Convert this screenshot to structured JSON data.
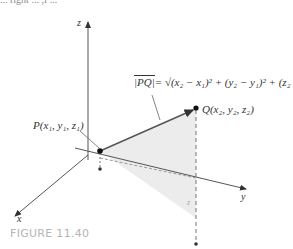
{
  "top_clip_text": "... right ... ,f ...",
  "axes": {
    "x": "x",
    "y": "y",
    "z": "z"
  },
  "formula": {
    "lhs": "|PQ|",
    "rhs": "= √(x₂ − x₁)² + (y₂ − y₁)² + (z₂ − z₁)²"
  },
  "points": {
    "P": "P(x₁, y₁, z₁)",
    "Q": "Q(x₂, y₂, z₂)"
  },
  "caption": "FIGURE 11.40",
  "colors": {
    "line": "#555555",
    "shade": "#ececec",
    "caption": "#b5b5b5"
  }
}
